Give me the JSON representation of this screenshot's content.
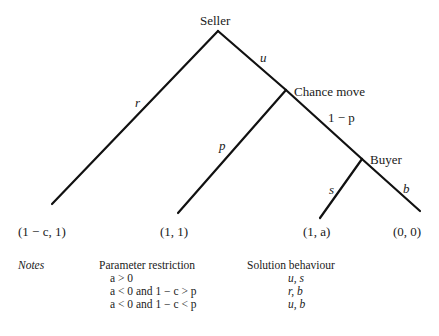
{
  "nodes": {
    "seller": "Seller",
    "chance": "Chance move",
    "buyer": "Buyer"
  },
  "edges": {
    "r": "r",
    "u": "u",
    "p": "p",
    "one_minus_p": "1 − p",
    "s": "s",
    "b": "b"
  },
  "payoffs": [
    "(1 − c, 1)",
    "(1, 1)",
    "(1, a)",
    "(0, 0)"
  ],
  "notes": {
    "label": "Notes",
    "param_header": "Parameter restriction",
    "solution_header": "Solution behaviour",
    "rows": [
      {
        "param": "a > 0",
        "solution": "u, s"
      },
      {
        "param": "a < 0 and 1 − c > p",
        "solution": "r, b"
      },
      {
        "param": "a < 0 and 1 − c < p",
        "solution": "u, b"
      }
    ]
  }
}
